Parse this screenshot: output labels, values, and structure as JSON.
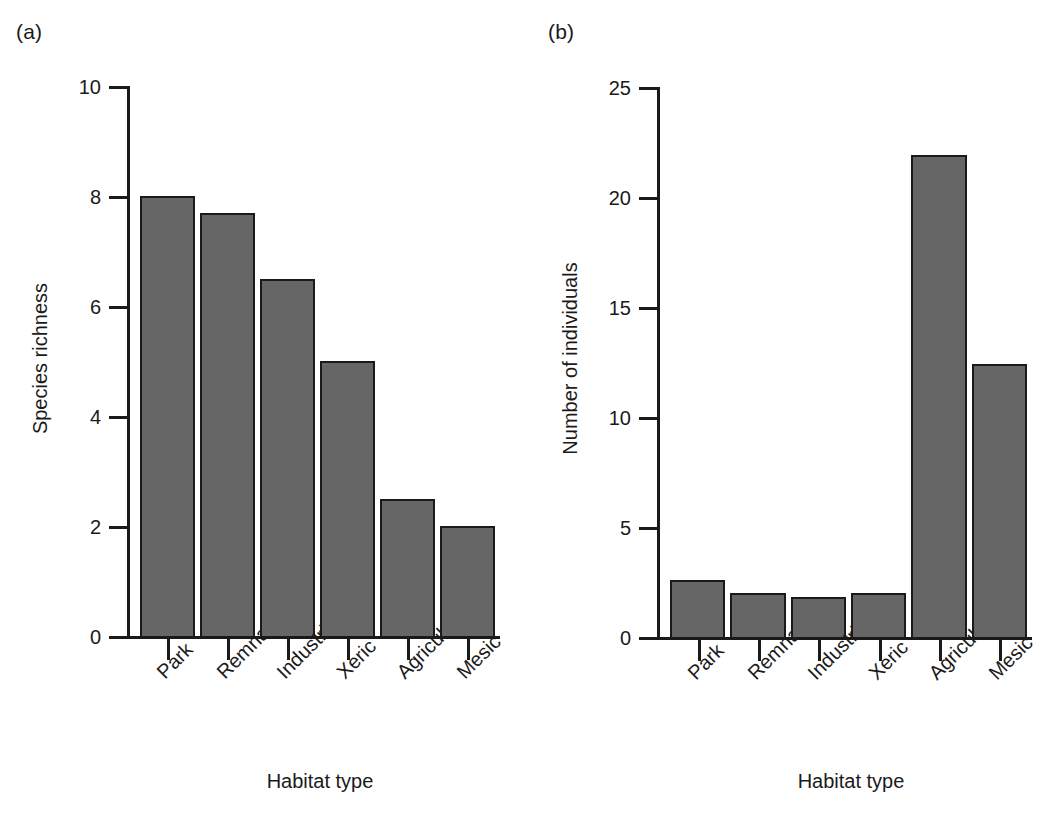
{
  "figure": {
    "background_color": "#ffffff",
    "bar_fill_color": "#666666",
    "bar_edge_color": "#1a1a1a",
    "axis_color": "#1a1a1a"
  },
  "panels": [
    {
      "label": "(a)",
      "chart_data": {
        "type": "bar",
        "title": "",
        "xlabel": "Habitat type",
        "ylabel": "Species richness",
        "categories": [
          "Park",
          "Remnant",
          "Industrial",
          "Xeric",
          "Agriculture",
          "Mesic"
        ],
        "values": [
          8.0,
          7.7,
          6.5,
          5.0,
          2.5,
          2.0
        ],
        "yticks": [
          0,
          2,
          4,
          6,
          8,
          10
        ],
        "ytick_labels": [
          "0",
          "2",
          "4",
          "6",
          "8",
          "10"
        ],
        "ylim": [
          0,
          10
        ],
        "grid": false,
        "legend": "none"
      }
    },
    {
      "label": "(b)",
      "chart_data": {
        "type": "bar",
        "title": "",
        "xlabel": "Habitat type",
        "ylabel": "Number of individuals",
        "categories": [
          "Park",
          "Remnant",
          "Industrial",
          "Xeric",
          "Agriculture",
          "Mesic"
        ],
        "values": [
          2.6,
          2.0,
          1.8,
          2.0,
          21.9,
          12.4
        ],
        "yticks": [
          0,
          5,
          10,
          15,
          20,
          25
        ],
        "ytick_labels": [
          "0",
          "5",
          "10",
          "15",
          "20",
          "25"
        ],
        "ylim": [
          0,
          25
        ],
        "grid": false,
        "legend": "none"
      }
    }
  ]
}
